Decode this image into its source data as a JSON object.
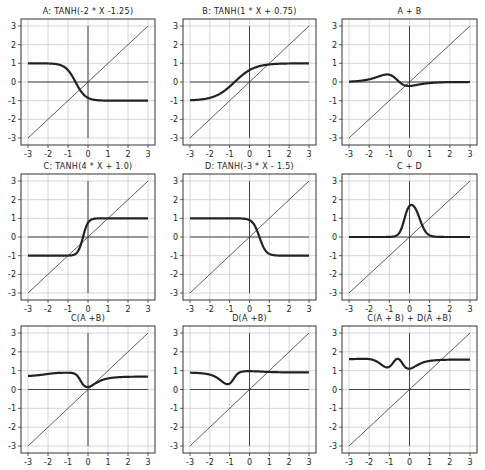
{
  "figure": {
    "grid": true,
    "xlim": [
      -3,
      3
    ],
    "ylim": [
      -3,
      3
    ],
    "xticks": [
      "-3",
      "-2",
      "-1",
      "0",
      "1",
      "2",
      "3"
    ],
    "yticks": [
      "3",
      "2",
      "1",
      "0",
      "-1",
      "-2",
      "-3"
    ],
    "colors": {
      "curve": "#222222",
      "identity": "#333333",
      "grid": "#cccccc",
      "frame": "#333333"
    }
  },
  "panels": [
    {
      "title": "A: TANH(-2 * X -1.25)"
    },
    {
      "title": "B: TANH(1 * X + 0.75)"
    },
    {
      "title": "A + B"
    },
    {
      "title": "C: TANH(4 * X + 1.0)"
    },
    {
      "title": "D: TANH(-3 * X - 1.5)"
    },
    {
      "title": "C + D"
    },
    {
      "title": "C(A +B)"
    },
    {
      "title": "D(A +B)"
    },
    {
      "title": "C(A + B) + D(A +B)"
    }
  ],
  "chart_data": [
    {
      "type": "line",
      "title": "A: TANH(-2 * X -1.25)",
      "xlabel": "",
      "ylabel": "",
      "xlim": [
        -3,
        3
      ],
      "ylim": [
        -3,
        3
      ],
      "grid": true,
      "series": [
        {
          "name": "A",
          "expr": "tanh(-2*x-1.25)",
          "x": [
            -3,
            -2,
            -1,
            -0.625,
            0,
            1,
            2,
            3
          ],
          "values": [
            1.0,
            0.99,
            0.64,
            0,
            -0.85,
            -1.0,
            -1.0,
            -1.0
          ]
        },
        {
          "name": "y=x",
          "x": [
            -3,
            3
          ],
          "values": [
            -3,
            3
          ]
        }
      ]
    },
    {
      "type": "line",
      "title": "B: TANH(1 * X + 0.75)",
      "xlabel": "",
      "ylabel": "",
      "xlim": [
        -3,
        3
      ],
      "ylim": [
        -3,
        3
      ],
      "grid": true,
      "series": [
        {
          "name": "B",
          "expr": "tanh(x+0.75)",
          "x": [
            -3,
            -2,
            -1,
            -0.75,
            0,
            1,
            2,
            3
          ],
          "values": [
            -0.98,
            -0.85,
            -0.24,
            0,
            0.64,
            0.94,
            0.99,
            1.0
          ]
        },
        {
          "name": "y=x",
          "x": [
            -3,
            3
          ],
          "values": [
            -3,
            3
          ]
        }
      ]
    },
    {
      "type": "line",
      "title": "A + B",
      "xlabel": "",
      "ylabel": "",
      "xlim": [
        -3,
        3
      ],
      "ylim": [
        -3,
        3
      ],
      "grid": true,
      "series": [
        {
          "name": "A+B",
          "x": [
            -3,
            -2,
            -1,
            0,
            1,
            2,
            3
          ],
          "values": [
            0.02,
            0.14,
            0.4,
            -0.21,
            -0.06,
            -0.01,
            0.0
          ]
        },
        {
          "name": "y=x",
          "x": [
            -3,
            3
          ],
          "values": [
            -3,
            3
          ]
        }
      ]
    },
    {
      "type": "line",
      "title": "C: TANH(4 * X + 1.0)",
      "xlabel": "",
      "ylabel": "",
      "xlim": [
        -3,
        3
      ],
      "ylim": [
        -3,
        3
      ],
      "grid": true,
      "series": [
        {
          "name": "C",
          "expr": "tanh(4*x+1)",
          "x": [
            -3,
            -1,
            -0.5,
            -0.25,
            0,
            0.5,
            1,
            3
          ],
          "values": [
            -1.0,
            -1.0,
            -0.76,
            0,
            0.76,
            1.0,
            1.0,
            1.0
          ]
        },
        {
          "name": "y=x",
          "x": [
            -3,
            3
          ],
          "values": [
            -3,
            3
          ]
        }
      ]
    },
    {
      "type": "line",
      "title": "D: TANH(-3 * X - 1.5)",
      "xlabel": "",
      "ylabel": "",
      "xlim": [
        -3,
        3
      ],
      "ylim": [
        -3,
        3
      ],
      "grid": true,
      "series": [
        {
          "name": "D",
          "expr": "tanh(-3*x+1.5)",
          "x": [
            -3,
            -1,
            0,
            0.5,
            1,
            2,
            3
          ],
          "values": [
            1.0,
            1.0,
            0.91,
            0,
            -0.91,
            -1.0,
            -1.0
          ]
        },
        {
          "name": "y=x",
          "x": [
            -3,
            3
          ],
          "values": [
            -3,
            3
          ]
        }
      ]
    },
    {
      "type": "line",
      "title": "C + D",
      "xlabel": "",
      "ylabel": "",
      "xlim": [
        -3,
        3
      ],
      "ylim": [
        -3,
        3
      ],
      "grid": true,
      "series": [
        {
          "name": "C+D",
          "x": [
            -3,
            -1,
            -0.5,
            0,
            0.1,
            0.25,
            0.5,
            1,
            3
          ],
          "values": [
            0,
            0,
            0.24,
            1.67,
            1.7,
            1.52,
            0.76,
            0.09,
            0
          ]
        },
        {
          "name": "y=x",
          "x": [
            -3,
            3
          ],
          "values": [
            -3,
            3
          ]
        }
      ]
    },
    {
      "type": "line",
      "title": "C(A +B)",
      "xlabel": "",
      "ylabel": "",
      "xlim": [
        -3,
        3
      ],
      "ylim": [
        -3,
        3
      ],
      "grid": true,
      "series": [
        {
          "name": "C(A+B)",
          "x": [
            -3,
            -2,
            -1,
            -0.5,
            0,
            0.5,
            1,
            2,
            3
          ],
          "values": [
            0.78,
            0.9,
            1.0,
            0.8,
            0.14,
            0.55,
            0.68,
            0.75,
            0.76
          ]
        },
        {
          "name": "y=x",
          "x": [
            -3,
            3
          ],
          "values": [
            -3,
            3
          ]
        }
      ]
    },
    {
      "type": "line",
      "title": "D(A +B)",
      "xlabel": "",
      "ylabel": "",
      "xlim": [
        -3,
        3
      ],
      "ylim": [
        -3,
        3
      ],
      "grid": true,
      "series": [
        {
          "name": "D(A+B)",
          "x": [
            -3,
            -2,
            -1.5,
            -1.1,
            -0.7,
            -0.3,
            0,
            1,
            2,
            3
          ],
          "values": [
            0.9,
            0.84,
            0.6,
            0.28,
            0.6,
            0.95,
            0.98,
            0.93,
            0.91,
            0.9
          ]
        },
        {
          "name": "y=x",
          "x": [
            -3,
            3
          ],
          "values": [
            -3,
            3
          ]
        }
      ]
    },
    {
      "type": "line",
      "title": "C(A + B) + D(A +B)",
      "xlabel": "",
      "ylabel": "",
      "xlim": [
        -3,
        3
      ],
      "ylim": [
        -3,
        3
      ],
      "grid": true,
      "series": [
        {
          "name": "C(A+B)+D(A+B)",
          "x": [
            -3,
            -2,
            -1.5,
            -1.1,
            -0.6,
            -0.3,
            0,
            0.5,
            1,
            2,
            3
          ],
          "values": [
            1.68,
            1.72,
            1.55,
            1.28,
            1.7,
            1.35,
            1.12,
            1.45,
            1.6,
            1.66,
            1.66
          ]
        },
        {
          "name": "y=x",
          "x": [
            -3,
            3
          ],
          "values": [
            -3,
            3
          ]
        }
      ]
    }
  ]
}
